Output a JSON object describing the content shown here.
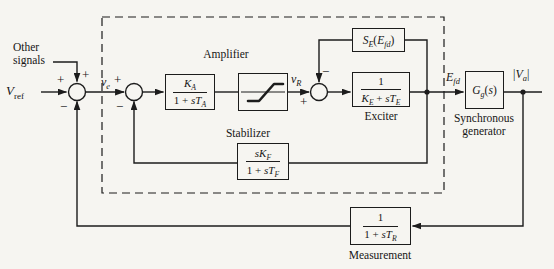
{
  "diagram": {
    "kind": "excitation-system-block-diagram",
    "colors": {
      "paper": "#f6f5f1",
      "ink": "#1c1c1c"
    },
    "inputs": {
      "other_signals": "Other signals",
      "v_ref": [
        {
          "t": "V"
        },
        {
          "t": "ref",
          "sub": true,
          "rm": true
        }
      ]
    },
    "signals": {
      "v_e": [
        {
          "t": "v"
        },
        {
          "t": "e",
          "sub": true
        }
      ],
      "v_R": [
        {
          "t": "v"
        },
        {
          "t": "R",
          "sub": true
        }
      ],
      "E_fd": [
        {
          "t": "E"
        },
        {
          "t": "fd",
          "sub": true
        }
      ],
      "V_a": [
        {
          "t": "|",
          "rm": true
        },
        {
          "t": "V"
        },
        {
          "t": "a",
          "sub": true
        },
        {
          "t": "|",
          "rm": true
        }
      ]
    },
    "signs": {
      "sum1_left": "+",
      "sum1_top": "+",
      "sum1_bottom": "−",
      "sum2_left": "+",
      "sum2_bottom": "−",
      "sum3_left": "+",
      "sum3_top": "−"
    },
    "blocks": {
      "amplifier": {
        "caption": "Amplifier",
        "numerator": [
          {
            "t": "K"
          },
          {
            "t": "A",
            "sub": true
          }
        ],
        "denominator": [
          {
            "t": "1 + ",
            "rm": true
          },
          {
            "t": "sT"
          },
          {
            "t": "A",
            "sub": true
          }
        ]
      },
      "saturation": {
        "glyph": "saturation-limiter"
      },
      "exciter_saturation": {
        "formula": [
          {
            "t": "S"
          },
          {
            "t": "E",
            "sub": true
          },
          {
            "t": "(",
            "rm": true
          },
          {
            "t": "E"
          },
          {
            "t": "fd",
            "sub": true
          },
          {
            "t": ")",
            "rm": true
          }
        ]
      },
      "exciter": {
        "caption": "Exciter",
        "numerator": [
          {
            "t": "1",
            "rm": true
          }
        ],
        "denominator": [
          {
            "t": "K"
          },
          {
            "t": "E",
            "sub": true
          },
          {
            "t": " + ",
            "rm": true
          },
          {
            "t": "sT"
          },
          {
            "t": "E",
            "sub": true
          }
        ]
      },
      "generator": {
        "caption": "Synchronous generator",
        "formula": [
          {
            "t": "G"
          },
          {
            "t": "g",
            "sub": true
          },
          {
            "t": "(",
            "rm": true
          },
          {
            "t": "s"
          },
          {
            "t": ")",
            "rm": true
          }
        ]
      },
      "stabilizer": {
        "caption": "Stabilizer",
        "numerator": [
          {
            "t": "sK"
          },
          {
            "t": "F",
            "sub": true
          }
        ],
        "denominator": [
          {
            "t": "1 + ",
            "rm": true
          },
          {
            "t": "sT"
          },
          {
            "t": "F",
            "sub": true
          }
        ]
      },
      "measurement": {
        "caption": "Measurement",
        "numerator": [
          {
            "t": "1",
            "rm": true
          }
        ],
        "denominator": [
          {
            "t": "1 + ",
            "rm": true
          },
          {
            "t": "sT"
          },
          {
            "t": "R",
            "sub": true
          }
        ]
      }
    }
  }
}
